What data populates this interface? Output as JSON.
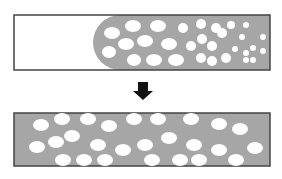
{
  "diagram": {
    "colors": {
      "background": "#ffffff",
      "fluid": "#a6a6a6",
      "border": "#444444",
      "bubble": "#ffffff",
      "arrow": "#111111"
    },
    "top_panel": {
      "box": {
        "x": 14,
        "y": 15,
        "w": 256,
        "h": 55
      },
      "fluid_front_x": 93,
      "bubbles": [
        [
          112,
          33,
          8,
          6
        ],
        [
          133,
          26,
          8,
          6
        ],
        [
          158,
          26,
          8,
          6
        ],
        [
          183,
          28,
          5,
          5
        ],
        [
          201,
          24,
          5,
          5
        ],
        [
          216,
          28,
          5,
          5
        ],
        [
          231,
          25,
          4,
          4
        ],
        [
          246,
          25,
          3,
          3
        ],
        [
          109,
          52,
          7,
          6
        ],
        [
          126,
          44,
          8,
          6
        ],
        [
          145,
          41,
          8,
          6
        ],
        [
          169,
          44,
          8,
          6
        ],
        [
          191,
          46,
          5,
          5
        ],
        [
          202,
          39,
          5,
          5
        ],
        [
          212,
          46,
          5,
          5
        ],
        [
          222,
          33,
          5,
          5
        ],
        [
          242,
          37,
          3,
          3
        ],
        [
          263,
          37,
          3,
          3
        ],
        [
          134,
          60,
          7,
          6
        ],
        [
          154,
          60,
          8,
          6
        ],
        [
          176,
          60,
          8,
          6
        ],
        [
          201,
          58,
          5,
          5
        ],
        [
          212,
          61,
          5,
          5
        ],
        [
          226,
          58,
          5,
          5
        ],
        [
          235,
          49,
          3,
          3
        ],
        [
          246,
          53,
          3,
          3
        ],
        [
          253,
          48,
          3,
          3
        ],
        [
          263,
          51,
          3,
          3
        ],
        [
          246,
          60,
          3,
          3
        ],
        [
          253,
          60,
          3,
          3
        ]
      ]
    },
    "arrow": {
      "x": 143,
      "y": 82,
      "label": "down-arrow"
    },
    "bottom_panel": {
      "box": {
        "x": 14,
        "y": 113,
        "w": 256,
        "h": 53
      },
      "bubbles": [
        [
          41,
          125,
          8,
          6
        ],
        [
          62,
          119,
          8,
          6
        ],
        [
          88,
          119,
          8,
          6
        ],
        [
          109,
          126,
          8,
          6
        ],
        [
          134,
          119,
          8,
          6
        ],
        [
          158,
          119,
          8,
          6
        ],
        [
          191,
          119,
          8,
          6
        ],
        [
          219,
          124,
          8,
          6
        ],
        [
          240,
          129,
          8,
          6
        ],
        [
          37,
          147,
          8,
          6
        ],
        [
          56,
          142,
          8,
          6
        ],
        [
          72,
          136,
          8,
          6
        ],
        [
          98,
          145,
          8,
          6
        ],
        [
          123,
          150,
          8,
          6
        ],
        [
          145,
          145,
          8,
          6
        ],
        [
          169,
          138,
          8,
          6
        ],
        [
          194,
          145,
          8,
          6
        ],
        [
          219,
          150,
          8,
          6
        ],
        [
          255,
          148,
          8,
          6
        ],
        [
          63,
          160,
          8,
          6
        ],
        [
          84,
          160,
          8,
          6
        ],
        [
          105,
          160,
          8,
          6
        ],
        [
          152,
          160,
          8,
          6
        ],
        [
          180,
          160,
          8,
          6
        ],
        [
          199,
          160,
          8,
          6
        ],
        [
          236,
          160,
          8,
          6
        ]
      ]
    }
  }
}
